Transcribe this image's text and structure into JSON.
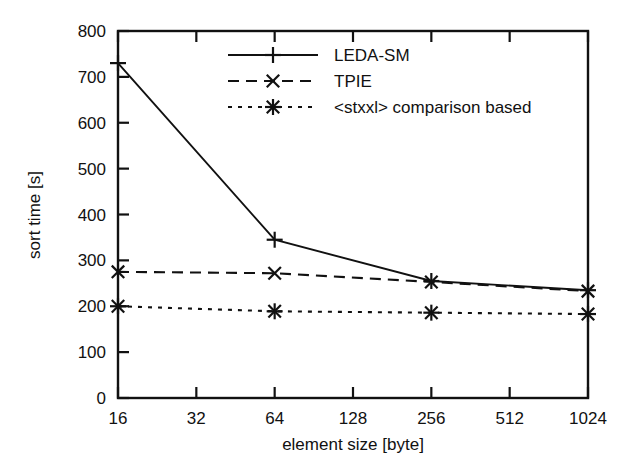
{
  "chart_data": {
    "type": "line",
    "title": "",
    "xlabel": "element size [byte]",
    "ylabel": "sort time [s]",
    "x_scale": "log2",
    "x": [
      16,
      32,
      64,
      128,
      256,
      512,
      1024
    ],
    "x_tick_labels": [
      "16",
      "32",
      "64",
      "128",
      "256",
      "512",
      "1024"
    ],
    "xlim": [
      16,
      1024
    ],
    "ylim": [
      0,
      800
    ],
    "y_ticks": [
      0,
      100,
      200,
      300,
      400,
      500,
      600,
      700,
      800
    ],
    "y_tick_labels": [
      "0",
      "100",
      "200",
      "300",
      "400",
      "500",
      "600",
      "700",
      "800"
    ],
    "grid": false,
    "legend_position": "top-center",
    "series": [
      {
        "name": "LEDA-SM",
        "marker": "plus",
        "line_style": "solid",
        "color": "#111111",
        "x": [
          16,
          64,
          256,
          1024
        ],
        "values": [
          730,
          345,
          255,
          235
        ]
      },
      {
        "name": "TPIE",
        "marker": "cross",
        "line_style": "dashed",
        "color": "#111111",
        "x": [
          16,
          64,
          256,
          1024
        ],
        "values": [
          275,
          272,
          253,
          233
        ]
      },
      {
        "name": "<stxxl> comparison based",
        "marker": "asterisk",
        "line_style": "dotted",
        "color": "#111111",
        "x": [
          16,
          64,
          256,
          1024
        ],
        "values": [
          200,
          189,
          186,
          183
        ]
      }
    ]
  },
  "axes": {
    "y_axis_label": "sort time [s]",
    "x_axis_label": "element size [byte]",
    "y_labels": [
      "800",
      "700",
      "600",
      "500",
      "400",
      "300",
      "200",
      "100",
      "0"
    ],
    "x_labels": [
      "16",
      "32",
      "64",
      "128",
      "256",
      "512",
      "1024"
    ]
  },
  "legend": {
    "entries": [
      {
        "label": "LEDA-SM",
        "marker": "plus-marker",
        "style": "solid"
      },
      {
        "label": "TPIE",
        "marker": "cross-marker",
        "style": "dashed"
      },
      {
        "label": "<stxxl> comparison based",
        "marker": "asterisk-marker",
        "style": "dotted"
      }
    ]
  },
  "style": {
    "ink": "#111111",
    "paper": "#ffffff"
  }
}
